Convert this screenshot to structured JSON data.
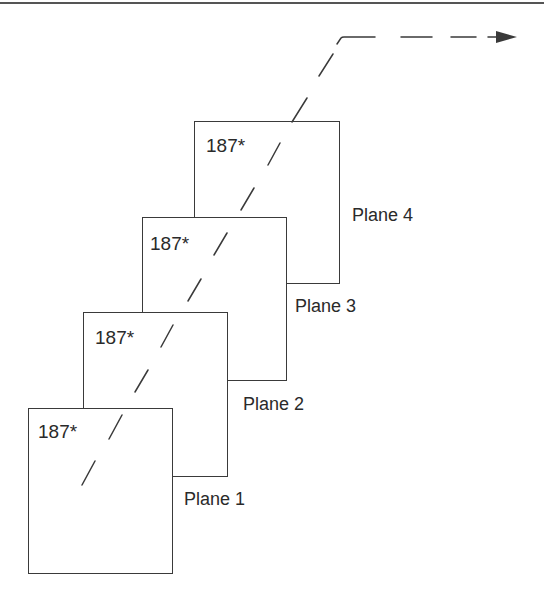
{
  "diagram": {
    "type": "stacked-planes",
    "planes": [
      {
        "name": "plane-1",
        "id_value": "187*",
        "label": "Plane 1"
      },
      {
        "name": "plane-2",
        "id_value": "187*",
        "label": "Plane 2"
      },
      {
        "name": "plane-3",
        "id_value": "187*",
        "label": "Plane 3"
      },
      {
        "name": "plane-4",
        "id_value": "187*",
        "label": "Plane 4"
      }
    ],
    "connector": {
      "style": "dashed",
      "direction": "up-right then right",
      "end": "arrowhead"
    },
    "colors": {
      "stroke": "#3a3a3a",
      "text": "#2a2a2a",
      "background": "#ffffff"
    }
  }
}
